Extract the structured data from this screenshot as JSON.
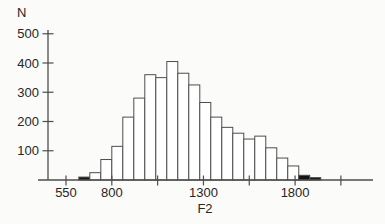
{
  "page": {
    "background": "#fbfbf9"
  },
  "chart_data": {
    "type": "bar",
    "subtype": "histogram",
    "title": "",
    "xlabel": "F2",
    "ylabel": "N",
    "grid": false,
    "legend": false,
    "xlim": [
      400,
      2225
    ],
    "ylim": [
      0,
      513
    ],
    "bin_width": 60,
    "bins": [
      {
        "start": 620,
        "n": 10,
        "filled": true
      },
      {
        "start": 680,
        "n": 25,
        "filled": false
      },
      {
        "start": 740,
        "n": 70,
        "filled": false
      },
      {
        "start": 800,
        "n": 115,
        "filled": false
      },
      {
        "start": 860,
        "n": 215,
        "filled": false
      },
      {
        "start": 920,
        "n": 280,
        "filled": false
      },
      {
        "start": 980,
        "n": 360,
        "filled": false
      },
      {
        "start": 1040,
        "n": 350,
        "filled": false
      },
      {
        "start": 1100,
        "n": 405,
        "filled": false
      },
      {
        "start": 1160,
        "n": 365,
        "filled": false
      },
      {
        "start": 1220,
        "n": 325,
        "filled": false
      },
      {
        "start": 1280,
        "n": 265,
        "filled": false
      },
      {
        "start": 1340,
        "n": 215,
        "filled": false
      },
      {
        "start": 1400,
        "n": 180,
        "filled": false
      },
      {
        "start": 1460,
        "n": 160,
        "filled": false
      },
      {
        "start": 1520,
        "n": 140,
        "filled": false
      },
      {
        "start": 1580,
        "n": 150,
        "filled": false
      },
      {
        "start": 1640,
        "n": 110,
        "filled": false
      },
      {
        "start": 1700,
        "n": 75,
        "filled": false
      },
      {
        "start": 1760,
        "n": 48,
        "filled": false
      },
      {
        "start": 1820,
        "n": 16,
        "filled": true
      },
      {
        "start": 1880,
        "n": 8,
        "filled": true
      }
    ],
    "x_ticks": [
      {
        "value": 550,
        "label": "550"
      },
      {
        "value": 800,
        "label": "800"
      },
      {
        "value": 1050,
        "label": ""
      },
      {
        "value": 1300,
        "label": "1300"
      },
      {
        "value": 1550,
        "label": ""
      },
      {
        "value": 1800,
        "label": "1800"
      },
      {
        "value": 2050,
        "label": ""
      }
    ],
    "y_ticks": [
      {
        "value": 100,
        "label": "100"
      },
      {
        "value": 200,
        "label": "200"
      },
      {
        "value": 300,
        "label": "300"
      },
      {
        "value": 400,
        "label": "400"
      },
      {
        "value": 500,
        "label": "500"
      }
    ],
    "colors": {
      "ink": "#4d4d4d",
      "text": "#262626",
      "bar_fill": "#ffffff",
      "bar_fill_dark": "#141414",
      "background": "#fbfbf9"
    }
  }
}
